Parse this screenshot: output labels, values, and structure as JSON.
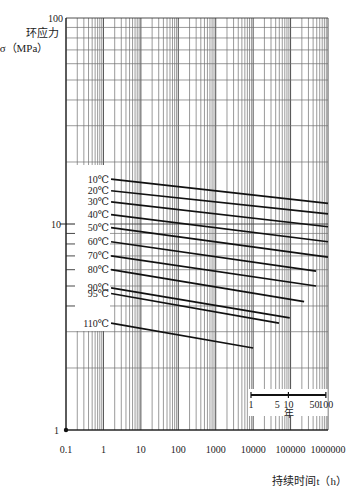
{
  "chart_data": {
    "type": "line",
    "title": "",
    "xscale": "log",
    "yscale": "log",
    "xlim": [
      0.1,
      1000000
    ],
    "ylim": [
      1,
      100
    ],
    "grid": true,
    "legend_position": "inline-left",
    "xlabel": "持续时间t（h）",
    "ylabel_line1": "环应力",
    "ylabel_line2": "σ（MPa）",
    "x_tick_values": [
      0.1,
      1,
      10,
      100,
      1000,
      10000,
      100000,
      1000000
    ],
    "x_tick_labels": [
      "0.1",
      "1",
      "10",
      "100",
      "1000",
      "10000",
      "100000",
      "1000000"
    ],
    "y_tick_values": [
      1,
      10,
      100
    ],
    "y_tick_labels": [
      "1",
      "10",
      "100"
    ],
    "series": [
      {
        "name": "10℃",
        "x": [
          1.6,
          1000000
        ],
        "y": [
          16.5,
          12.6
        ]
      },
      {
        "name": "20℃",
        "x": [
          1.6,
          1000000
        ],
        "y": [
          14.5,
          11.2
        ]
      },
      {
        "name": "30℃",
        "x": [
          1.6,
          1000000
        ],
        "y": [
          12.8,
          9.7
        ]
      },
      {
        "name": "40℃",
        "x": [
          1.6,
          1000000
        ],
        "y": [
          11.1,
          8.2
        ]
      },
      {
        "name": "50℃",
        "x": [
          1.6,
          1000000
        ],
        "y": [
          9.6,
          6.9
        ]
      },
      {
        "name": "60℃",
        "x": [
          1.6,
          480000
        ],
        "y": [
          8.2,
          5.9
        ]
      },
      {
        "name": "70℃",
        "x": [
          1.6,
          480000
        ],
        "y": [
          7.0,
          5.0
        ]
      },
      {
        "name": "80℃",
        "x": [
          1.6,
          230000
        ],
        "y": [
          6.0,
          4.2
        ]
      },
      {
        "name": "90℃",
        "x": [
          1.6,
          95000
        ],
        "y": [
          4.9,
          3.5
        ]
      },
      {
        "name": "95℃",
        "x": [
          1.6,
          49000
        ],
        "y": [
          4.6,
          3.3
        ]
      },
      {
        "name": "110℃",
        "x": [
          1.6,
          10000
        ],
        "y": [
          3.3,
          2.5
        ]
      }
    ],
    "secondary_axis": {
      "label": "年",
      "tick_labels": [
        "1",
        "5",
        "10",
        "50",
        "100"
      ],
      "tick_values_years": [
        1,
        5,
        10,
        50,
        100
      ],
      "hours_per_year": 8760
    }
  }
}
